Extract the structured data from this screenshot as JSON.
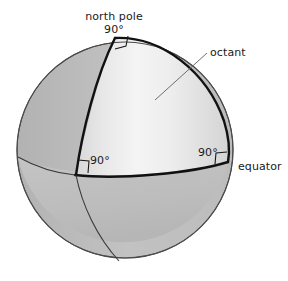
{
  "figure": {
    "background_color": "#ffffff",
    "labels": {
      "north_pole": "north pole",
      "pole_angle": "90°",
      "octant": "octant",
      "equator": "equator",
      "angle_left": "90°",
      "angle_right": "90°"
    },
    "colors": {
      "sphere_back": "#bebebe",
      "sphere_shadow": "#b4b4b4",
      "octant_light": "#f2f2f2",
      "octant_mid": "#dcdcdc",
      "outline": "#111111",
      "thin_line": "#333333",
      "leader_line": "#6e6e6e",
      "text": "#1a1a1a"
    },
    "geometry": {
      "circle_center_x": 125,
      "circle_center_y": 150,
      "circle_radius": 108,
      "north_pole_x": 115,
      "north_pole_y": 38
    }
  }
}
